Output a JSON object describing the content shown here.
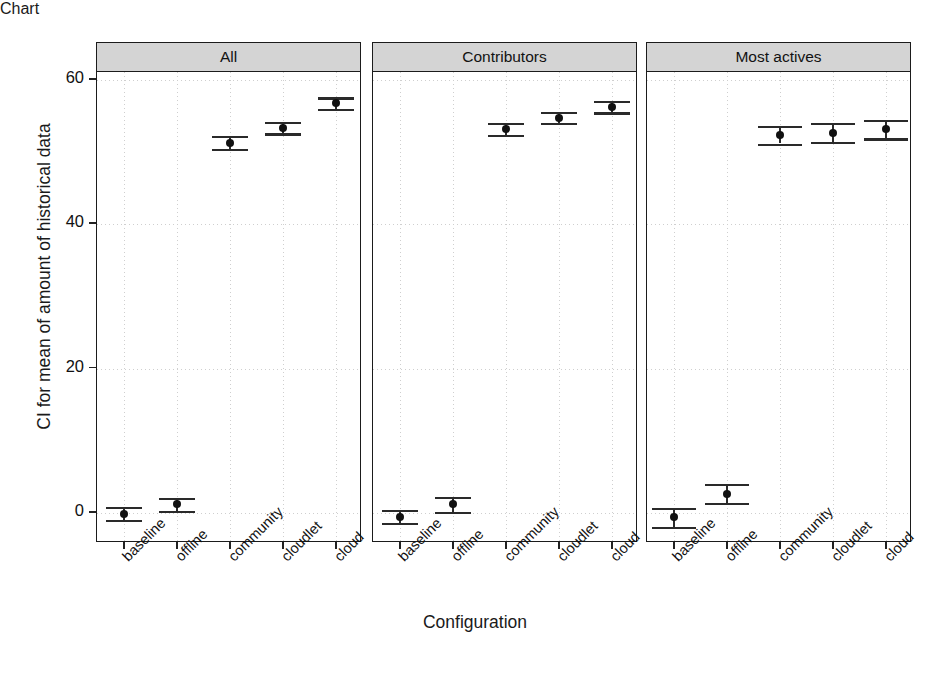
{
  "chart_data": {
    "type": "scatter",
    "title": "",
    "xlabel": "Configuration",
    "ylabel": "CI for mean of amount of historical data",
    "ylim": [
      -3,
      60
    ],
    "yticks": [
      0,
      20,
      40,
      60
    ],
    "ytick_labels": [
      "0",
      "20",
      "40",
      "60"
    ],
    "grid": true,
    "legend": "none",
    "categories": [
      "baseline",
      "offline",
      "community",
      "cloudlet",
      "cloud"
    ],
    "panels": [
      {
        "label": "All",
        "values": [
          -0.1,
          1.2,
          51.3,
          53.4,
          56.8
        ],
        "ci_low": [
          -1.0,
          0.3,
          50.4,
          52.6,
          56.0
        ],
        "ci_high": [
          0.8,
          2.1,
          52.2,
          54.2,
          57.6
        ]
      },
      {
        "label": "Contributors",
        "values": [
          -0.5,
          1.2,
          53.2,
          54.8,
          56.3
        ],
        "ci_low": [
          -1.4,
          0.2,
          52.4,
          54.0,
          55.5
        ],
        "ci_high": [
          0.4,
          2.2,
          54.0,
          55.6,
          57.1
        ]
      },
      {
        "label": "Most actives",
        "values": [
          -0.6,
          2.7,
          52.4,
          52.7,
          53.2
        ],
        "ci_low": [
          -1.9,
          1.4,
          51.2,
          51.4,
          51.9
        ],
        "ci_high": [
          0.7,
          4.0,
          53.6,
          54.0,
          54.5
        ]
      }
    ]
  },
  "axis": {
    "y_title": "CI for mean of amount of historical data",
    "x_title": "Configuration"
  },
  "style": {
    "strip_fill": "#d4d4d4",
    "frame_color": "#1b1b1b",
    "point_color": "#111111",
    "grid_color": "#cfcfcf"
  }
}
